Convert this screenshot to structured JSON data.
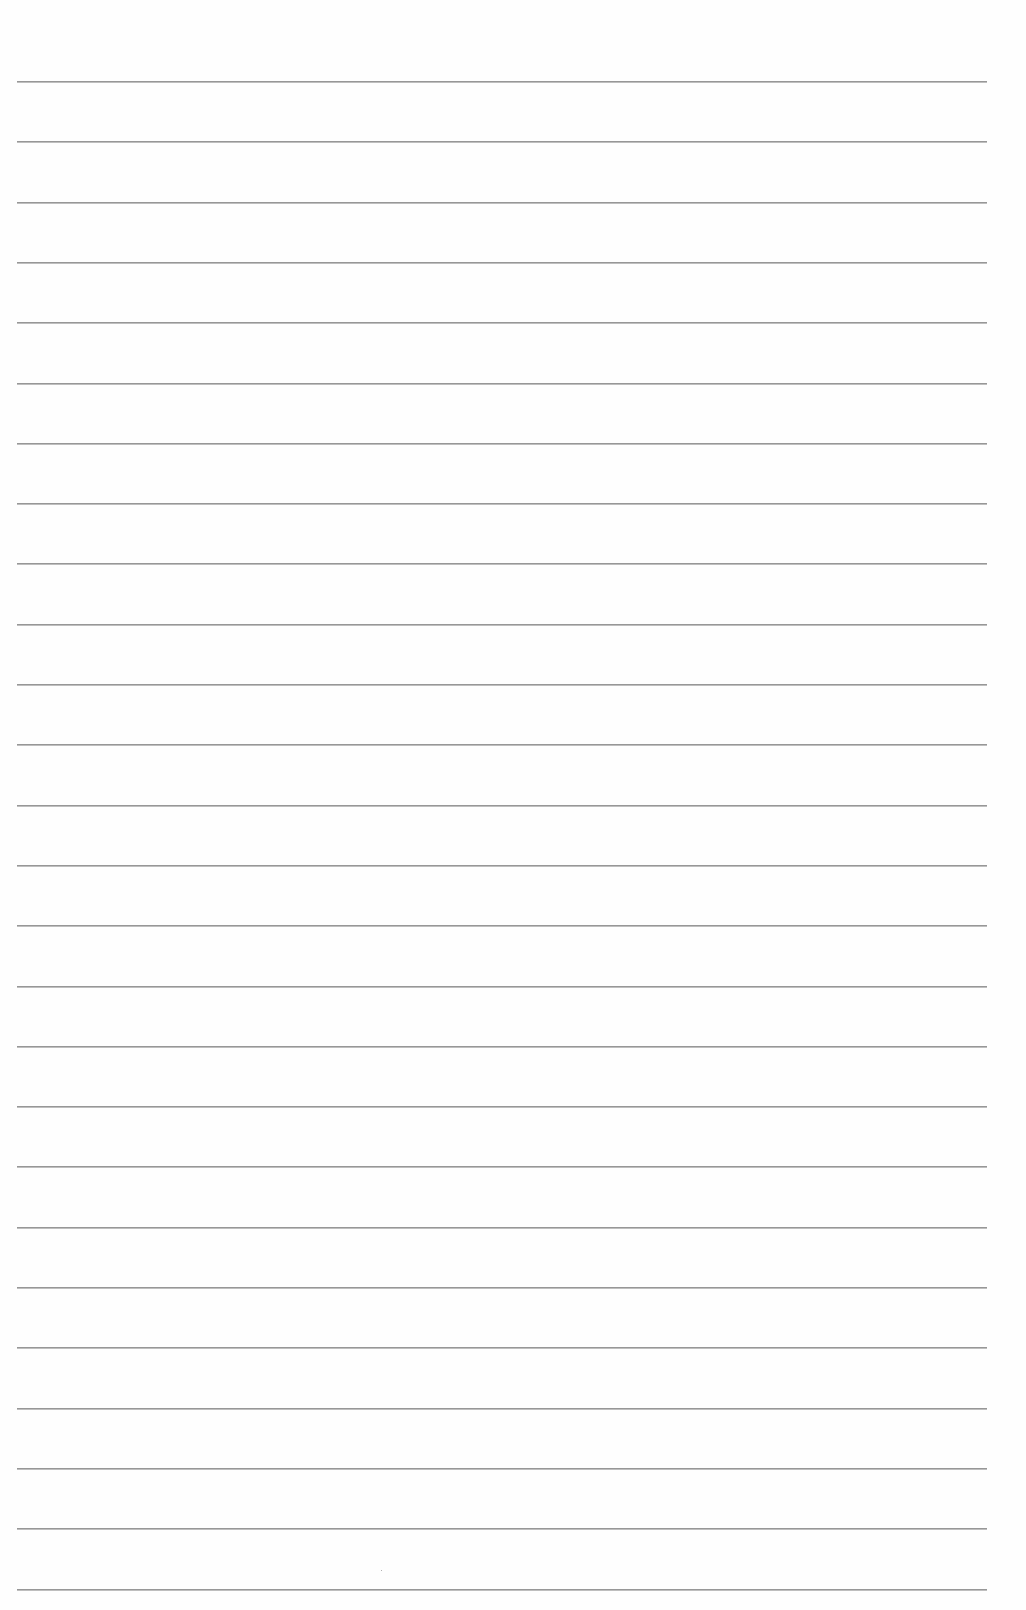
{
  "page": {
    "type": "blank lined paper",
    "background_color": "#fefefe",
    "rule_color": "#8c8c8c",
    "rule_count": 26,
    "first_rule_y": 81,
    "rule_spacing": 60.3,
    "rule_left": 17,
    "rule_right": 987,
    "text_content": []
  }
}
